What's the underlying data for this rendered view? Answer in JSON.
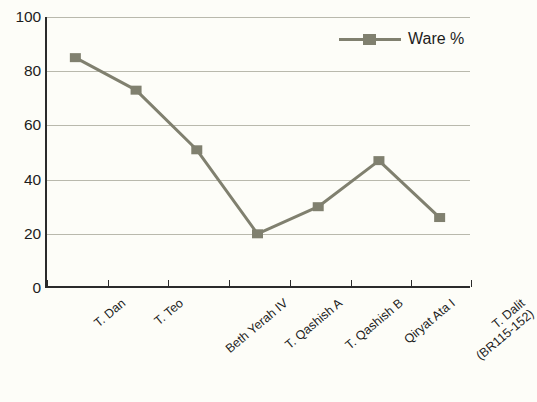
{
  "chart_data": {
    "type": "line",
    "title": "",
    "subtitle": "",
    "xlabel": "",
    "ylabel": "",
    "ylim": [
      0,
      100
    ],
    "yticks": [
      0,
      20,
      40,
      60,
      80,
      100
    ],
    "grid": true,
    "legend_position": "top-right",
    "categories": [
      "T. Dan",
      "T. Teo",
      "Beth Yerah IV",
      "T. Qashish A",
      "T. Qashish B",
      "Qiryat Ata I",
      "T. Dalit (BR115-152)"
    ],
    "category_lines": [
      [
        "T. Dan"
      ],
      [
        "T. Teo"
      ],
      [
        "Beth Yerah IV"
      ],
      [
        "T. Qashish A"
      ],
      [
        "T. Qashish B"
      ],
      [
        "Qiryat Ata I"
      ],
      [
        "T. Dalit",
        "(BR115-152)"
      ]
    ],
    "series": [
      {
        "name": "Ware %",
        "values": [
          85,
          73,
          51,
          20,
          30,
          47,
          26
        ],
        "color": "#80806f",
        "marker": "square"
      }
    ]
  },
  "legend": {
    "entries": [
      {
        "label": "Ware %",
        "color": "#80806f"
      }
    ]
  },
  "axes": {
    "y": {
      "tick_labels": [
        "100",
        "80",
        "60",
        "40",
        "20",
        "0"
      ]
    }
  },
  "caption": {
    "text": ""
  },
  "colors": {
    "series": "#80806f",
    "gridline": "#b9b9ad",
    "axis": "#2b2b2b",
    "background": "#fdfdf8",
    "text": "#1d1d1d"
  }
}
